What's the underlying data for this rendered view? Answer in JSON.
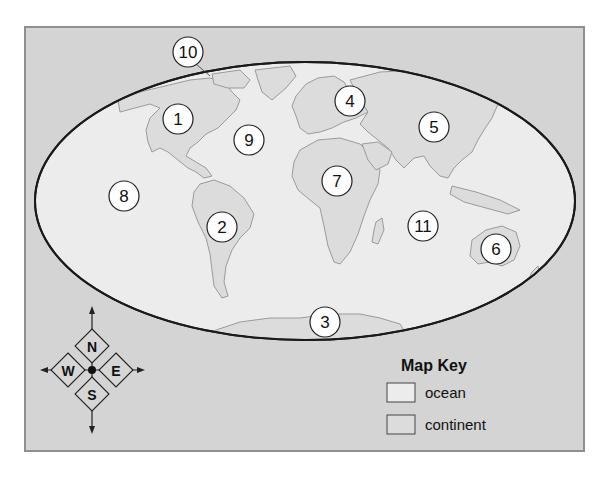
{
  "map": {
    "projection_shape": "ellipse",
    "colors": {
      "frame_background": "#d4d4d4",
      "frame_border": "#8f8f8f",
      "ocean": "#ececec",
      "continent": "#dcdcdc",
      "coastline": "#9a9a9a",
      "ellipse_outline": "#1a1a1a"
    },
    "labels": [
      {
        "number": "1",
        "region": "North America"
      },
      {
        "number": "2",
        "region": "South America"
      },
      {
        "number": "3",
        "region": "Antarctica"
      },
      {
        "number": "4",
        "region": "Europe"
      },
      {
        "number": "5",
        "region": "Asia"
      },
      {
        "number": "6",
        "region": "Australia"
      },
      {
        "number": "7",
        "region": "Africa"
      },
      {
        "number": "8",
        "region": "Pacific Ocean"
      },
      {
        "number": "9",
        "region": "Atlantic Ocean"
      },
      {
        "number": "10",
        "region": "Arctic Ocean"
      },
      {
        "number": "11",
        "region": "Indian Ocean"
      }
    ]
  },
  "compass": {
    "north": "N",
    "south": "S",
    "east": "E",
    "west": "W"
  },
  "map_key": {
    "title": "Map Key",
    "items": [
      {
        "label": "ocean",
        "color": "#ececec"
      },
      {
        "label": "continent",
        "color": "#dcdcdc"
      }
    ]
  }
}
